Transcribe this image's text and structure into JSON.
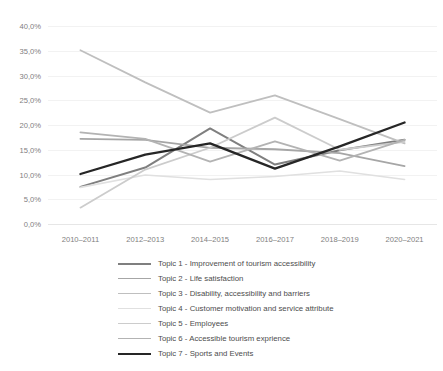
{
  "chart_data": {
    "type": "line",
    "title": "",
    "xlabel": "",
    "ylabel": "",
    "categories": [
      "2010–2011",
      "2012–2013",
      "2014–2015",
      "2016–2017",
      "2018–2019",
      "2020–2021"
    ],
    "ylim": [
      0,
      40
    ],
    "y_ticks": [
      0,
      5,
      10,
      15,
      20,
      25,
      30,
      35,
      40
    ],
    "y_tick_labels": [
      "0,0%",
      "5,0%",
      "10,0%",
      "15,0%",
      "20,0%",
      "25,0%",
      "30,0%",
      "35,0%",
      "40,0%"
    ],
    "grid": true,
    "legend_position": "bottom",
    "value_suffix": "%",
    "decimal_separator": ",",
    "series": [
      {
        "name": "Topic 1 - Improvement of tourism accessibility",
        "color": "#7f7f7f",
        "width": 2.0,
        "values": [
          7.5,
          11.4,
          19.3,
          12.0,
          14.9,
          17.0
        ]
      },
      {
        "name": "Topic 2 - Life satisfaction",
        "color": "#a6a6a6",
        "width": 1.8,
        "values": [
          17.2,
          17.0,
          15.4,
          15.1,
          14.3,
          11.7
        ]
      },
      {
        "name": "Topic 3 - Disability, accessibility and barriers",
        "color": "#bfbfbf",
        "width": 1.8,
        "values": [
          35.1,
          28.6,
          22.5,
          26.0,
          21.2,
          16.3
        ]
      },
      {
        "name": "Topic 4 - Customer motivation and service attribute",
        "color": "#e0e0e0",
        "width": 1.6,
        "values": [
          7.4,
          9.9,
          9.0,
          9.6,
          10.7,
          9.0
        ]
      },
      {
        "name": "Topic 5 - Employees",
        "color": "#cccccc",
        "width": 1.8,
        "values": [
          3.3,
          11.0,
          15.4,
          21.5,
          15.0,
          16.6
        ]
      },
      {
        "name": "Topic 6 - Accessible tourism exprience",
        "color": "#b3b3b3",
        "width": 1.8,
        "values": [
          18.5,
          17.2,
          12.6,
          16.7,
          12.8,
          17.0
        ]
      },
      {
        "name": "Topic 7 - Sports and Events",
        "color": "#262626",
        "width": 2.3,
        "values": [
          10.1,
          14.0,
          16.3,
          11.2,
          15.7,
          20.5
        ]
      }
    ]
  }
}
